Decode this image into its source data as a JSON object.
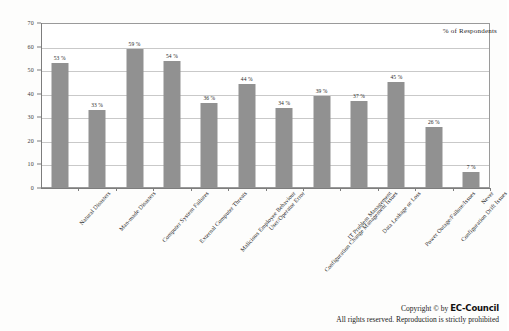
{
  "chart_data": {
    "type": "bar",
    "title": "",
    "subtitle": "",
    "xlabel": "",
    "ylabel": "",
    "ylim": [
      0,
      70
    ],
    "ytick_step": 10,
    "yticks": [
      "0",
      "10",
      "20",
      "30",
      "40",
      "50",
      "60",
      "70"
    ],
    "grid": true,
    "legend_position": "top-right",
    "legend": [
      "% of Respondents"
    ],
    "bar_color": "#919191",
    "categories": [
      "Natural Disasters",
      "Man-made Disasters",
      "Computer System Failures",
      "External Computer Threats",
      "Malicious Employee Behaviour",
      "User/Operator Error",
      "Configuration Change Management Issues",
      "IT Problem Management",
      "Data Leakage or Loss",
      "Power Outage/Failure/Issues",
      "Configuration Drift Issues",
      "Never"
    ],
    "values": [
      53,
      33,
      59,
      54,
      36,
      44,
      34,
      39,
      37,
      45,
      26,
      7
    ],
    "value_labels": [
      "53 %",
      "33 %",
      "59 %",
      "54 %",
      "36 %",
      "44 %",
      "34 %",
      "39 %",
      "37 %",
      "45 %",
      "26 %",
      "7 %"
    ]
  },
  "legend": {
    "series_label": "% of Respondents"
  },
  "footer": {
    "copyright_prefix": "Copyright © by ",
    "brand": "EC-Council",
    "rights": "All rights reserved. Reproduction is strictly prohibited"
  }
}
